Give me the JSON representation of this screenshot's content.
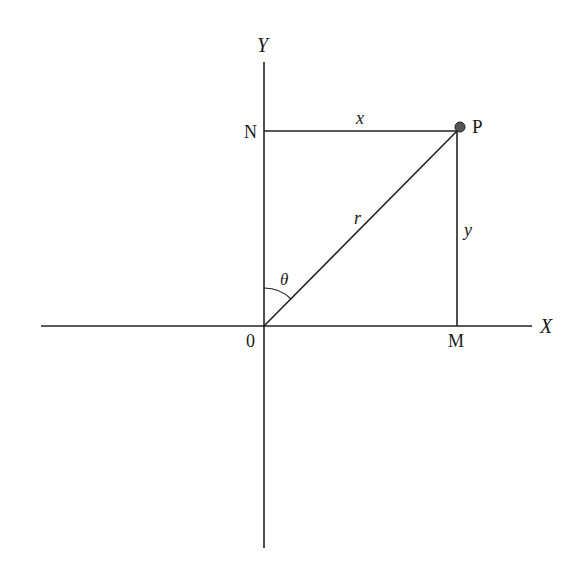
{
  "diagram": {
    "type": "coordinate-geometry",
    "colors": {
      "line": "#222222",
      "point": "#555555",
      "background": "#ffffff"
    },
    "axes": {
      "x_label": "X",
      "y_label": "Y",
      "origin_label": "0"
    },
    "points": {
      "P": "P",
      "N": "N",
      "M": "M"
    },
    "segments": {
      "x_label": "x",
      "y_label": "y",
      "r_label": "r"
    },
    "angle": {
      "label": "θ"
    }
  }
}
